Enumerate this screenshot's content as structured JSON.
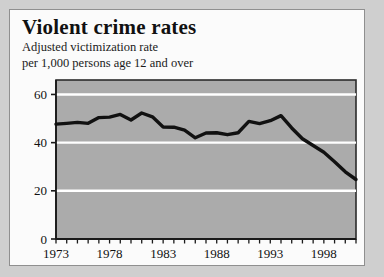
{
  "card": {
    "title": "Violent crime rates",
    "subtitle_line1": "Adjusted victimization rate",
    "subtitle_line2": "per 1,000 persons age 12 and over"
  },
  "colors": {
    "page_background": "#cfcfcf",
    "card_background": "#fbfbfb",
    "plot_fill": "#ababab",
    "gridline": "#ffffff",
    "line": "#111111",
    "axis": "#1a1a1a"
  },
  "chart_data": {
    "type": "line",
    "title": "Violent crime rates",
    "subtitle": "Adjusted victimization rate per 1,000 persons age 12 and over",
    "xlabel": "",
    "ylabel": "",
    "grid": true,
    "legend": "none",
    "xlim": [
      1973,
      2001
    ],
    "ylim": [
      0,
      66
    ],
    "yticks": [
      0,
      20,
      40,
      60
    ],
    "ytick_labels": [
      "0",
      "20",
      "40",
      "60"
    ],
    "xticks": [
      1973,
      1974,
      1975,
      1976,
      1977,
      1978,
      1979,
      1980,
      1981,
      1982,
      1983,
      1984,
      1985,
      1986,
      1987,
      1988,
      1989,
      1990,
      1991,
      1992,
      1993,
      1994,
      1995,
      1996,
      1997,
      1998,
      1999,
      2000,
      2001
    ],
    "xtick_labels": [
      "1973",
      "1978",
      "1983",
      "1988",
      "1993",
      "1998"
    ],
    "xtick_label_values": [
      1973,
      1978,
      1983,
      1988,
      1993,
      1998
    ],
    "x": [
      1973,
      1974,
      1975,
      1976,
      1977,
      1978,
      1979,
      1980,
      1981,
      1982,
      1983,
      1984,
      1985,
      1986,
      1987,
      1988,
      1989,
      1990,
      1991,
      1992,
      1993,
      1994,
      1995,
      1996,
      1997,
      1998,
      1999,
      2000,
      2001
    ],
    "values": [
      47.7,
      48.0,
      48.4,
      48.0,
      50.4,
      50.6,
      51.7,
      49.4,
      52.3,
      50.7,
      46.5,
      46.4,
      45.2,
      42.0,
      44.0,
      44.1,
      43.3,
      44.1,
      48.8,
      47.9,
      49.1,
      51.2,
      46.1,
      41.6,
      38.8,
      36.0,
      32.1,
      27.9,
      24.7
    ]
  }
}
